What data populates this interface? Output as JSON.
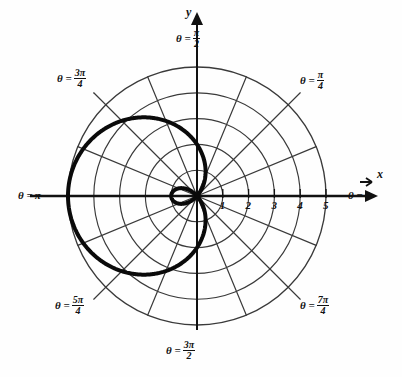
{
  "figure": {
    "kind": "polar-plot",
    "background": "#fefefe",
    "ink": "#111111",
    "grid_color": "#3a3a3a",
    "curve_color": "#0a0a0a"
  },
  "axes": {
    "x_axis_label": "x",
    "y_axis_label": "y",
    "radial_ticks": [
      "1",
      "2",
      "3",
      "4",
      "5"
    ],
    "radial_tick_values": [
      1,
      2,
      3,
      4,
      5
    ]
  },
  "angle_labels": [
    {
      "id": "theta-0",
      "eq": "θ =",
      "value": "0",
      "num": null,
      "den": null,
      "deg": 0
    },
    {
      "id": "theta-pi-4",
      "eq": "θ =",
      "value": null,
      "num": "π",
      "den": "4",
      "deg": 45
    },
    {
      "id": "theta-pi-2",
      "eq": "θ =",
      "value": null,
      "num": "π",
      "den": "2",
      "deg": 90
    },
    {
      "id": "theta-3pi-4",
      "eq": "θ =",
      "value": null,
      "num": "3π",
      "den": "4",
      "deg": 135
    },
    {
      "id": "theta-pi",
      "eq": "θ =",
      "value": "π",
      "num": null,
      "den": null,
      "deg": 180
    },
    {
      "id": "theta-5pi-4",
      "eq": "θ =",
      "value": null,
      "num": "5π",
      "den": "4",
      "deg": 225
    },
    {
      "id": "theta-3pi-2",
      "eq": "θ =",
      "value": null,
      "num": "3π",
      "den": "2",
      "deg": 270
    },
    {
      "id": "theta-7pi-4",
      "eq": "θ =",
      "value": null,
      "num": "7π",
      "den": "4",
      "deg": 315
    }
  ],
  "chart_data": {
    "type": "line",
    "coordinate_system": "polar",
    "title": "",
    "xlabel": "x",
    "ylabel": "y",
    "grid": true,
    "legend": null,
    "axis_origin_px": [
      197,
      196
    ],
    "unit_px": 25.8,
    "radial_axis": {
      "ticks": [
        1,
        2,
        3,
        4,
        5
      ],
      "tick_labels": [
        "1",
        "2",
        "3",
        "4",
        "5"
      ],
      "rlim": [
        0,
        5.2
      ]
    },
    "angular_axis": {
      "spoke_count": 16,
      "spoke_step_deg": 22.5,
      "labeled_angles_deg": [
        0,
        45,
        90,
        135,
        180,
        225,
        270,
        315
      ],
      "labeled_angles_text": [
        "0",
        "π/4",
        "π/2",
        "3π/4",
        "π",
        "5π/4",
        "3π/2",
        "7π/4"
      ]
    },
    "grid_circles_r": [
      1,
      2,
      3,
      4,
      5
    ],
    "series": [
      {
        "name": "limacon",
        "equation": "r = 2 - 3 cos(θ)",
        "a": 2,
        "b": 3,
        "has_inner_loop": true,
        "max_r": 5,
        "inner_loop_max_r": 1,
        "points_theta_deg": [
          0,
          5,
          10,
          15,
          20,
          25,
          30,
          35,
          40,
          45,
          50,
          55,
          60,
          65,
          70,
          75,
          80,
          85,
          90,
          95,
          100,
          105,
          110,
          115,
          120,
          125,
          130,
          135,
          140,
          145,
          150,
          155,
          160,
          165,
          170,
          175,
          180,
          185,
          190,
          195,
          200,
          205,
          210,
          215,
          220,
          225,
          230,
          235,
          240,
          245,
          250,
          255,
          260,
          265,
          270,
          275,
          280,
          285,
          290,
          295,
          300,
          305,
          310,
          315,
          320,
          325,
          330,
          335,
          340,
          345,
          350,
          355,
          360
        ],
        "points_r": [
          -1,
          -0.989,
          -0.955,
          -0.898,
          -0.819,
          -0.719,
          -0.598,
          -0.457,
          -0.298,
          -0.121,
          0.072,
          0.279,
          0.5,
          0.732,
          0.974,
          1.224,
          1.479,
          1.739,
          2,
          2.261,
          2.521,
          2.776,
          3.026,
          3.268,
          3.5,
          3.721,
          3.928,
          4.121,
          4.298,
          4.457,
          4.598,
          4.719,
          4.819,
          4.898,
          4.955,
          4.989,
          5,
          4.989,
          4.955,
          4.898,
          4.819,
          4.719,
          4.598,
          4.457,
          4.298,
          4.121,
          3.928,
          3.721,
          3.5,
          3.268,
          3.026,
          2.776,
          2.521,
          2.261,
          2,
          1.739,
          1.479,
          1.224,
          0.974,
          0.732,
          0.5,
          0.279,
          0.072,
          -0.121,
          -0.298,
          -0.457,
          -0.598,
          -0.719,
          -0.819,
          -0.898,
          -0.955,
          -0.989,
          -1
        ]
      }
    ]
  }
}
